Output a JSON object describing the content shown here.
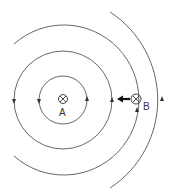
{
  "diagram": {
    "points": [
      {
        "label": "A",
        "symbol": "current-into-page"
      },
      {
        "label": "B",
        "symbol": "current-into-page"
      }
    ],
    "field_lines": 4,
    "force_arrow": {
      "from": "B",
      "direction": "toward A"
    },
    "colors": {
      "line": "#555555",
      "background": "#ffffff"
    }
  }
}
